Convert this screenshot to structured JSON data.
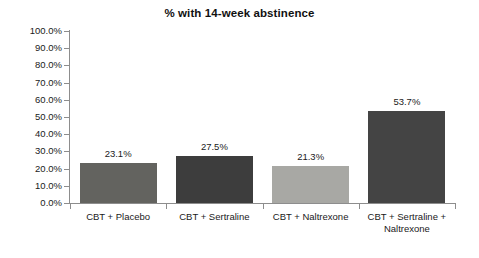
{
  "chart_data": {
    "type": "bar",
    "title": "% with 14-week abstinence",
    "xlabel": "",
    "ylabel": "",
    "ylim": [
      0,
      100
    ],
    "ytick_labels": [
      "100.0%",
      "90.0%",
      "80.0%",
      "70.0%",
      "60.0%",
      "50.0%",
      "40.0%",
      "30.0%",
      "20.0%",
      "10.0%",
      "0.0%"
    ],
    "ytick_values": [
      100,
      90,
      80,
      70,
      60,
      50,
      40,
      30,
      20,
      10,
      0
    ],
    "grid": false,
    "legend": "none",
    "categories": [
      "CBT + Placebo",
      "CBT + Sertraline",
      "CBT + Naltrexone",
      "CBT + Sertraline + Naltrexone"
    ],
    "values": [
      23.1,
      27.5,
      21.3,
      53.7
    ],
    "data_labels": [
      "23.1%",
      "27.5%",
      "21.3%",
      "53.7%"
    ],
    "bar_colors": [
      "#63635f",
      "#3d3d3d",
      "#a8a8a4",
      "#444444"
    ],
    "axis_color": "#8d8d8d",
    "text_color": "#1a1a1a",
    "background": "#ffffff"
  }
}
